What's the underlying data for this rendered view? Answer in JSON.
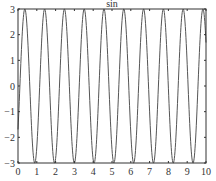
{
  "chart_data": {
    "type": "line",
    "title": "sin",
    "xlabel": "",
    "ylabel": "",
    "xlim": [
      0,
      10
    ],
    "ylim": [
      -3,
      3
    ],
    "xticks": [
      0,
      1,
      2,
      3,
      4,
      5,
      6,
      7,
      8,
      9,
      10
    ],
    "yticks": [
      -3,
      -2,
      -1,
      0,
      1,
      2,
      3
    ],
    "grid": false,
    "legend": null,
    "series": [
      {
        "name": "3*sin",
        "amplitude": 3,
        "cycles_in_range": 9.5,
        "color": "#555555"
      }
    ]
  },
  "colors": {
    "line": "#555555",
    "axis": "#333333",
    "background": "#ffffff"
  }
}
